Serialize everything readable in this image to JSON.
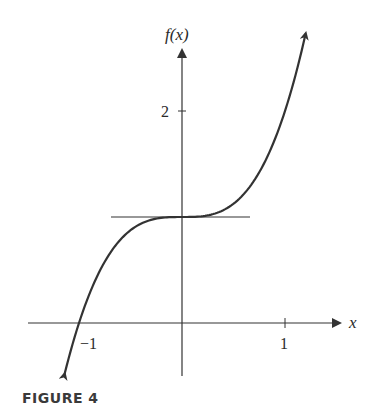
{
  "figure": {
    "caption": "FIGURE 4",
    "y_axis_label": "f(x)",
    "x_axis_label": "x",
    "ticks": {
      "x": [
        {
          "value": -1,
          "label": "−1"
        },
        {
          "value": 1,
          "label": "1"
        }
      ],
      "y": [
        {
          "value": 2,
          "label": "2"
        }
      ]
    },
    "colors": {
      "curve": "#333333",
      "axis": "#333333",
      "tangent": "#333333"
    }
  },
  "chart_data": {
    "type": "line",
    "title": "FIGURE 4",
    "xlabel": "x",
    "ylabel": "f(x)",
    "function": "f(x) = x^3 + 1",
    "xlim": [
      -1.5,
      1.6
    ],
    "ylim": [
      -0.7,
      2.6
    ],
    "grid": false,
    "legend": null,
    "series": [
      {
        "name": "f(x)",
        "x": [
          -1.14,
          -1.0,
          -0.8,
          -0.6,
          -0.4,
          -0.2,
          0.0,
          0.2,
          0.4,
          0.6,
          0.8,
          1.0,
          1.2
        ],
        "values": [
          -0.48,
          0.0,
          0.49,
          0.78,
          0.94,
          0.99,
          1.0,
          1.01,
          1.06,
          1.22,
          1.51,
          2.0,
          2.73
        ]
      },
      {
        "name": "horizontal tangent at x=0",
        "x": [
          -0.69,
          0.66
        ],
        "values": [
          1.0,
          1.0
        ]
      }
    ],
    "annotations": [
      "Curve has arrows at both ends",
      "Horizontal tangent line at (0, 1)",
      "Curve crosses x-axis at x = -1"
    ]
  }
}
